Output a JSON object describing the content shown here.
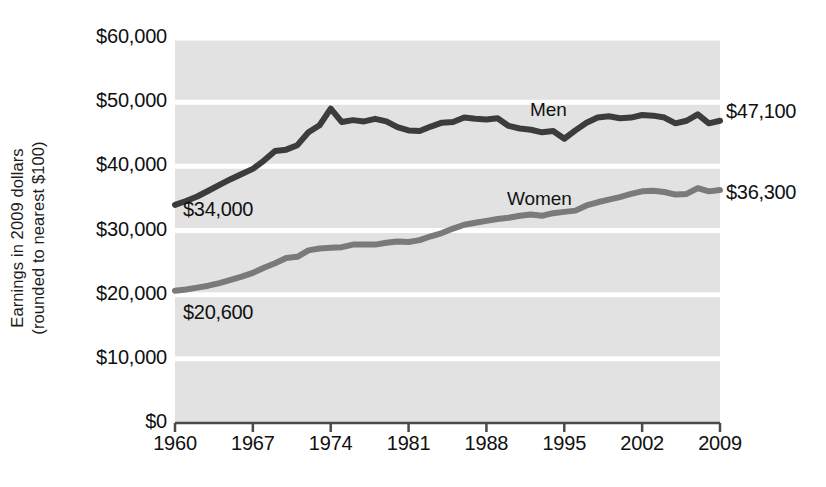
{
  "chart_data": {
    "type": "line",
    "title": "",
    "xlabel": "",
    "ylabel": "Earnings in 2009 dollars\n(rounded to nearest $100)",
    "xlim": [
      1960,
      2009
    ],
    "ylim": [
      0,
      60000
    ],
    "grid": "horizontal",
    "legend_position": "inline-annotation",
    "plot_background": "#e2e2e2",
    "y_ticks": [
      {
        "value": 60000,
        "label": "$60,000"
      },
      {
        "value": 50000,
        "label": "$50,000"
      },
      {
        "value": 40000,
        "label": "$40,000"
      },
      {
        "value": 30000,
        "label": "$30,000"
      },
      {
        "value": 20000,
        "label": "$20,000"
      },
      {
        "value": 10000,
        "label": "$10,000"
      },
      {
        "value": 0,
        "label": "$0"
      }
    ],
    "x_ticks": [
      {
        "value": 1960,
        "label": "1960"
      },
      {
        "value": 1967,
        "label": "1967"
      },
      {
        "value": 1974,
        "label": "1974"
      },
      {
        "value": 1981,
        "label": "1981"
      },
      {
        "value": 1988,
        "label": "1988"
      },
      {
        "value": 1995,
        "label": "1995"
      },
      {
        "value": 2002,
        "label": "2002"
      },
      {
        "value": 2009,
        "label": "2009"
      }
    ],
    "x": [
      1960,
      1961,
      1962,
      1963,
      1964,
      1965,
      1966,
      1967,
      1968,
      1969,
      1970,
      1971,
      1972,
      1973,
      1974,
      1975,
      1976,
      1977,
      1978,
      1979,
      1980,
      1981,
      1982,
      1983,
      1984,
      1985,
      1986,
      1987,
      1988,
      1989,
      1990,
      1991,
      1992,
      1993,
      1994,
      1995,
      1996,
      1997,
      1998,
      1999,
      2000,
      2001,
      2002,
      2003,
      2004,
      2005,
      2006,
      2007,
      2008,
      2009
    ],
    "series": [
      {
        "name": "Men",
        "color": "#3c3c3c",
        "end_label": "$47,100",
        "start_label": "$34,000",
        "values": [
          34000,
          34600,
          35300,
          36200,
          37100,
          38000,
          38800,
          39600,
          40900,
          42400,
          42600,
          43300,
          45300,
          46400,
          49000,
          46900,
          47200,
          47000,
          47400,
          47000,
          46100,
          45600,
          45500,
          46200,
          46800,
          46900,
          47600,
          47400,
          47300,
          47500,
          46300,
          45900,
          45700,
          45300,
          45500,
          44300,
          45600,
          46800,
          47600,
          47800,
          47500,
          47600,
          48000,
          47900,
          47600,
          46700,
          47100,
          48100,
          46700,
          47100
        ]
      },
      {
        "name": "Women",
        "color": "#7a7a7a",
        "end_label": "$36,300",
        "start_label": "$20,600",
        "values": [
          20600,
          20800,
          21100,
          21400,
          21800,
          22300,
          22800,
          23400,
          24200,
          24900,
          25700,
          25900,
          26900,
          27200,
          27300,
          27400,
          27800,
          27800,
          27800,
          28100,
          28300,
          28200,
          28500,
          29100,
          29600,
          30300,
          30900,
          31200,
          31500,
          31800,
          32000,
          32300,
          32500,
          32300,
          32700,
          32900,
          33100,
          33900,
          34400,
          34800,
          35200,
          35700,
          36100,
          36200,
          36000,
          35600,
          35700,
          36600,
          36100,
          36300
        ]
      }
    ],
    "annotations": [
      {
        "text": "Men",
        "x": 1995,
        "kind": "series-name"
      },
      {
        "text": "Women",
        "x": 1993,
        "kind": "series-name"
      },
      {
        "text": "$34,000",
        "kind": "start-value"
      },
      {
        "text": "$20,600",
        "kind": "start-value"
      },
      {
        "text": "$47,100",
        "kind": "end-value"
      },
      {
        "text": "$36,300",
        "kind": "end-value"
      }
    ]
  },
  "axis": {
    "y_title": "Earnings in 2009 dollars\n(rounded to nearest $100)"
  }
}
